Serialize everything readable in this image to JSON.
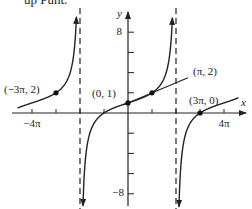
{
  "caption": "up Punt.",
  "chart_data": {
    "type": "line",
    "title": "",
    "function": "y = tan(x/4) + 1",
    "xlabel": "x",
    "ylabel": "y",
    "xlim": [
      -4.6,
      4.6
    ],
    "ylim": [
      -9,
      9
    ],
    "x_unit": "pi",
    "x_tick_labels": [
      {
        "value": -4,
        "label": "−4π"
      },
      {
        "value": 4,
        "label": "4π"
      }
    ],
    "x_ticks": [
      -4,
      -3,
      -2,
      -1,
      1,
      2,
      3,
      4
    ],
    "y_tick_labels": [
      {
        "value": 8,
        "label": "8"
      },
      {
        "value": -8,
        "label": "−8"
      }
    ],
    "y_ticks": [
      -8,
      -6,
      -4,
      -2,
      2,
      4,
      6,
      8
    ],
    "asymptotes_x": [
      -2,
      2
    ],
    "points": [
      {
        "x": -3,
        "y": 2,
        "label": "(−3π, 2)"
      },
      {
        "x": 0,
        "y": 1,
        "label": "(0, 1)"
      },
      {
        "x": 1,
        "y": 2,
        "label": "(π, 2)"
      },
      {
        "x": 3,
        "y": 0,
        "label": "(3π, 0)"
      }
    ],
    "line": {
      "through": [
        [
          0,
          1
        ],
        [
          1,
          2
        ]
      ],
      "slope_per_pi": 1
    },
    "grid": false,
    "legend": null
  }
}
